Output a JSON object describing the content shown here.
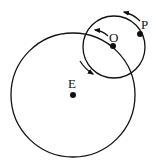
{
  "diagram": {
    "type": "epicycle",
    "labels": {
      "earth": "E",
      "epicycle_center": "O",
      "planet": "P"
    },
    "deferent": {
      "cx": 73,
      "cy": 95,
      "r": 62
    },
    "epicycle": {
      "cx": 114,
      "cy": 47,
      "r": 31
    },
    "points": {
      "E": {
        "x": 73,
        "y": 95
      },
      "O": {
        "x": 113,
        "y": 46
      },
      "P": {
        "x": 140,
        "y": 34
      }
    },
    "colors": {
      "stroke": "#111111",
      "background": "#ffffff"
    }
  }
}
